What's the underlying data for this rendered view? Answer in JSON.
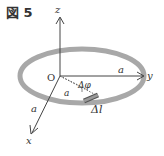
{
  "figure": {
    "title": "図 5",
    "labels": {
      "z_axis": "z",
      "y_axis": "y",
      "x_axis": "x",
      "origin": "O",
      "radius_y": "a",
      "radius_x": "a",
      "radius_diag": "a",
      "angle": "Δφ",
      "arc_element": "Δl"
    },
    "colors": {
      "ring": "#a8a8a8",
      "axes": "#444444",
      "element": "#555555"
    }
  }
}
